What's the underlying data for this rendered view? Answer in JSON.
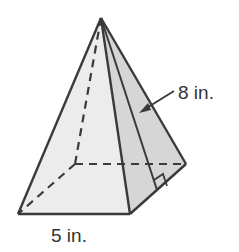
{
  "diagram": {
    "type": "square-pyramid",
    "labels": {
      "slant_height": "8 in.",
      "base_edge": "5 in."
    },
    "colors": {
      "stroke": "#3a3a3a",
      "front_face": "#ececec",
      "right_face": "#d6d6d6",
      "background": "#ffffff"
    }
  }
}
